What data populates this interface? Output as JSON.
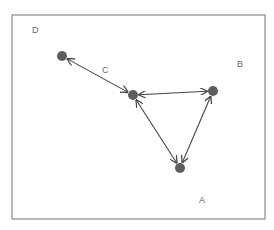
{
  "diagram": {
    "frame": {
      "x": 12,
      "y": 15,
      "width": 253,
      "height": 204,
      "stroke": "#8a8a8a"
    },
    "colors": {
      "node": "#5e5e5e",
      "edge": "#444444",
      "label": "#666666"
    },
    "nodes": [
      {
        "id": "n1",
        "x": 62,
        "y": 56
      },
      {
        "id": "n2",
        "x": 133,
        "y": 95
      },
      {
        "id": "n3",
        "x": 213,
        "y": 91
      },
      {
        "id": "n4",
        "x": 180,
        "y": 168
      }
    ],
    "edges": [
      {
        "from": "n1",
        "to": "n2",
        "direction": "both"
      },
      {
        "from": "n2",
        "to": "n3",
        "direction": "both"
      },
      {
        "from": "n2",
        "to": "n4",
        "direction": "both"
      },
      {
        "from": "n3",
        "to": "n4",
        "direction": "both"
      }
    ],
    "labels": [
      {
        "text": "D",
        "x": 32,
        "y": 33
      },
      {
        "text": "C",
        "x": 102,
        "y": 73
      },
      {
        "text": "B",
        "x": 237,
        "y": 67
      },
      {
        "text": "A",
        "x": 199,
        "y": 203
      }
    ]
  }
}
